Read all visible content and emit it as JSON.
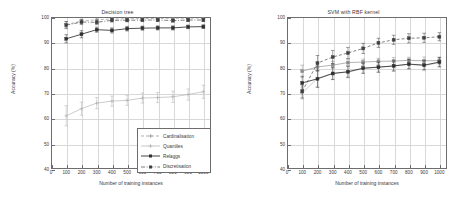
{
  "figure": {
    "background": "#ffffff",
    "panel_count": 2
  },
  "axis_common": {
    "xlabel": "Number of training instances",
    "ylabel": "Accuracy (%)",
    "xticks": [
      0,
      100,
      200,
      300,
      400,
      500,
      600,
      700,
      800,
      900,
      1000
    ],
    "yticks": [
      40,
      50,
      60,
      70,
      80,
      90,
      100
    ],
    "xlim": [
      0,
      1050
    ],
    "ylim": [
      40,
      100
    ],
    "grid": true
  },
  "series_names": {
    "cardinalisation": "Cardinalisation",
    "quantiles": "Quantiles",
    "relaggs": "Relaggs",
    "discretisation": "Discretisation"
  },
  "colors": {
    "cardinalisation": "#8c8c8c",
    "quantiles": "#b0b0b0",
    "relaggs": "#303030",
    "discretisation": "#404040",
    "axis": "#6d6d6d",
    "grid": "#d8d8d8",
    "text": "#3a3a3a"
  },
  "chart_data": [
    {
      "type": "line",
      "title": "Decision tree",
      "xlabel": "Number of training instances",
      "ylabel": "Accuracy (%)",
      "xlim": [
        0,
        1050
      ],
      "ylim": [
        40,
        100
      ],
      "xticks": [
        0,
        100,
        200,
        300,
        400,
        500,
        600,
        700,
        800,
        900,
        1000
      ],
      "yticks": [
        40,
        50,
        60,
        70,
        80,
        90,
        100
      ],
      "grid": true,
      "legend_position": "lower right",
      "x": [
        100,
        200,
        300,
        400,
        500,
        600,
        700,
        800,
        900,
        1000
      ],
      "series": [
        {
          "name": "Cardinalisation",
          "linestyle": "dashed",
          "marker": "plus",
          "values": [
            97.0,
            98.4,
            98.9,
            99.2,
            99.3,
            99.4,
            99.4,
            99.5,
            99.5,
            99.6
          ],
          "errors": [
            1.2,
            0.8,
            0.6,
            0.5,
            0.4,
            0.4,
            0.4,
            0.4,
            0.3,
            0.3
          ]
        },
        {
          "name": "Quantiles",
          "linestyle": "solid",
          "marker": "plus",
          "values": [
            61.0,
            63.8,
            66.0,
            66.8,
            67.1,
            68.0,
            68.2,
            68.5,
            69.4,
            70.5
          ],
          "errors": [
            4.0,
            2.6,
            2.2,
            2.0,
            2.0,
            2.0,
            2.0,
            2.2,
            2.2,
            2.6
          ]
        },
        {
          "name": "Relaggs",
          "linestyle": "solid",
          "marker": "square",
          "values": [
            91.4,
            93.2,
            95.0,
            94.7,
            95.4,
            95.6,
            95.7,
            95.7,
            96.1,
            96.2
          ],
          "errors": [
            1.6,
            1.4,
            1.0,
            1.0,
            0.9,
            0.8,
            0.8,
            0.8,
            0.7,
            0.7
          ]
        },
        {
          "name": "Discretisation",
          "linestyle": "dashdot",
          "marker": "square",
          "values": [
            96.8,
            98.0,
            97.9,
            98.7,
            98.7,
            98.8,
            98.8,
            98.6,
            98.8,
            98.8
          ],
          "errors": [
            1.4,
            1.0,
            0.9,
            0.7,
            0.6,
            0.6,
            0.6,
            0.6,
            0.6,
            0.6
          ]
        }
      ]
    },
    {
      "type": "line",
      "title": "SVM with RBF kernel",
      "xlabel": "Number of training instances",
      "ylabel": "Accuracy (%)",
      "xlim": [
        0,
        1050
      ],
      "ylim": [
        40,
        100
      ],
      "xticks": [
        0,
        100,
        200,
        300,
        400,
        500,
        600,
        700,
        800,
        900,
        1000
      ],
      "yticks": [
        40,
        50,
        60,
        70,
        80,
        90,
        100
      ],
      "grid": true,
      "legend_position": "lower right",
      "x": [
        100,
        200,
        300,
        400,
        500,
        600,
        700,
        800,
        900,
        1000
      ],
      "series": [
        {
          "name": "Cardinalisation",
          "linestyle": "solid",
          "marker": "square",
          "values": [
            78.6,
            80.3,
            81.0,
            82.0,
            82.2,
            82.5,
            82.6,
            82.9,
            82.7,
            82.8
          ],
          "errors": [
            2.4,
            1.8,
            1.5,
            1.3,
            1.2,
            1.2,
            1.4,
            1.2,
            1.5,
            1.4
          ]
        },
        {
          "name": "Quantiles",
          "linestyle": "solid",
          "marker": "plus",
          "values": [
            70.0,
            75.8,
            77.8,
            78.2,
            79.7,
            80.2,
            80.6,
            81.3,
            80.8,
            82.0
          ],
          "errors": [
            2.4,
            3.2,
            2.4,
            2.2,
            2.0,
            2.0,
            2.0,
            2.0,
            2.0,
            1.8
          ]
        },
        {
          "name": "Relaggs",
          "linestyle": "solid",
          "marker": "square",
          "values": [
            74.0,
            75.6,
            77.7,
            78.4,
            79.8,
            80.2,
            80.7,
            81.4,
            81.0,
            82.2
          ],
          "errors": [
            2.6,
            3.4,
            2.4,
            2.2,
            2.0,
            2.0,
            2.0,
            1.8,
            1.8,
            1.8
          ]
        },
        {
          "name": "Discretisation",
          "linestyle": "dashed",
          "marker": "square",
          "values": [
            70.6,
            81.8,
            84.2,
            85.8,
            87.6,
            89.8,
            91.0,
            91.6,
            91.8,
            92.2
          ],
          "errors": [
            2.6,
            3.0,
            2.6,
            2.2,
            2.0,
            1.8,
            1.8,
            1.8,
            1.8,
            1.6
          ]
        }
      ]
    }
  ],
  "legends": [
    {
      "items": [
        {
          "label": "Cardinalisation",
          "style": "dashed-plus"
        },
        {
          "label": "Quantiles",
          "style": "solid-plus-light"
        },
        {
          "label": "Relaggs",
          "style": "solid-square-dark"
        },
        {
          "label": "Discretisation",
          "style": "dashdot-square"
        }
      ]
    },
    {
      "items": [
        {
          "label": "Cardinalisation",
          "style": "solid-plus"
        },
        {
          "label": "Quantiles",
          "style": "solid-plus-light"
        },
        {
          "label": "Relaggs",
          "style": "solid-square-dark"
        },
        {
          "label": "Discretisation",
          "style": "dashed-square"
        }
      ]
    }
  ]
}
